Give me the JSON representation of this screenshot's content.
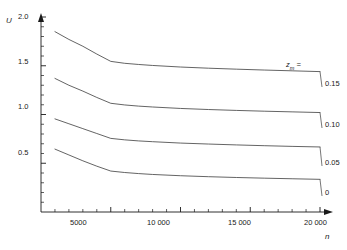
{
  "chart_data": {
    "type": "line",
    "title": "",
    "xlabel": "n",
    "ylabel": "U",
    "xlim": [
      0,
      20000
    ],
    "ylim": [
      0,
      2.0
    ],
    "grid": false,
    "legend_position": "right-of-plot",
    "legend_title": "zm =",
    "x_ticks_major": [
      5000,
      10000,
      15000,
      20000
    ],
    "x_tick_labels": [
      "5000",
      "10 000",
      "15 000",
      "20 000"
    ],
    "x_minor_tick_step": 1000,
    "y_ticks_major": [
      0.5,
      1.0,
      1.5,
      2.0
    ],
    "y_tick_labels": [
      "0.5",
      "1.0",
      "1.5",
      "2.0"
    ],
    "y_minor_tick_step": 0.1,
    "series": [
      {
        "name": "0.15",
        "label": "0.15",
        "x": [
          1000,
          2000,
          3000,
          4000,
          5000,
          6000,
          7000,
          8000,
          10000,
          12000,
          14000,
          16000,
          18000,
          20000
        ],
        "values": [
          1.85,
          1.77,
          1.7,
          1.62,
          1.545,
          1.525,
          1.513,
          1.503,
          1.487,
          1.475,
          1.465,
          1.456,
          1.448,
          1.44
        ]
      },
      {
        "name": "0.10",
        "label": "0.10",
        "x": [
          1000,
          2000,
          3000,
          4000,
          5000,
          6000,
          7000,
          8000,
          10000,
          12000,
          14000,
          16000,
          18000,
          20000
        ],
        "values": [
          1.37,
          1.3,
          1.24,
          1.175,
          1.115,
          1.098,
          1.086,
          1.077,
          1.062,
          1.051,
          1.042,
          1.034,
          1.027,
          1.02
        ]
      },
      {
        "name": "0.05",
        "label": "0.05",
        "x": [
          1000,
          2000,
          3000,
          4000,
          5000,
          6000,
          7000,
          8000,
          10000,
          12000,
          14000,
          16000,
          18000,
          20000
        ],
        "values": [
          0.955,
          0.905,
          0.855,
          0.805,
          0.755,
          0.74,
          0.729,
          0.721,
          0.707,
          0.697,
          0.688,
          0.68,
          0.673,
          0.667
        ]
      },
      {
        "name": "0",
        "label": "0",
        "x": [
          1000,
          2000,
          3000,
          4000,
          5000,
          6000,
          7000,
          8000,
          10000,
          12000,
          14000,
          16000,
          18000,
          20000
        ],
        "values": [
          0.645,
          0.585,
          0.525,
          0.47,
          0.42,
          0.405,
          0.394,
          0.385,
          0.372,
          0.362,
          0.354,
          0.347,
          0.341,
          0.335
        ]
      }
    ],
    "line_color": "#3c3c3c",
    "axis_color": "#1a1a1a"
  },
  "axes": {
    "y_label": "U",
    "x_label": "n"
  },
  "x_tick_text": {
    "t5000": "5000",
    "t10000": "10 000",
    "t15000": "15 000",
    "t20000": "20 000"
  },
  "y_tick_text": {
    "t05": "0.5",
    "t10": "1.0",
    "t15": "1.5",
    "t20": "2.0"
  },
  "series_labels": {
    "s1": "0.15",
    "s2": "0.10",
    "s3": "0.05",
    "s4": "0"
  },
  "legend": {
    "title_var": "z",
    "title_sub": "m",
    "title_eq": " ="
  }
}
